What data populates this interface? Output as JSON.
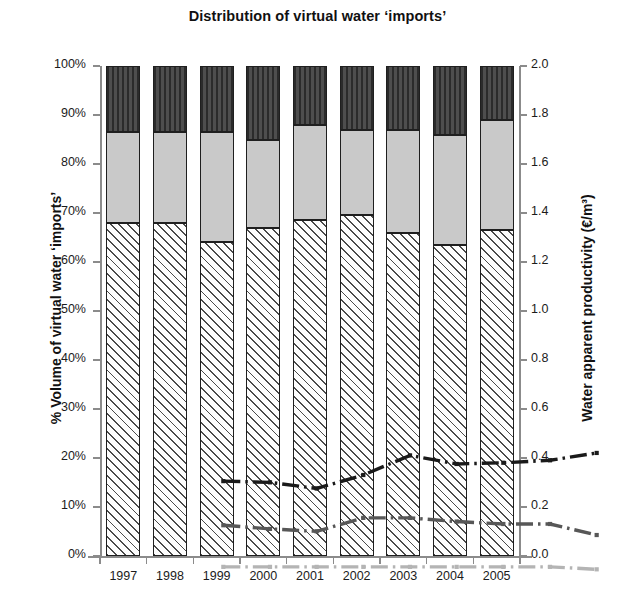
{
  "chart_data": {
    "type": "bar",
    "title": "Distribution of virtual water ‘imports’",
    "subtitle": "",
    "xlabel": "",
    "ylabel": "% Volume of virtual water ‘imports’",
    "ylabel_secondary": "Water apparent productivity (€/m³)",
    "categories": [
      "1997",
      "1998",
      "1999",
      "2000",
      "2001",
      "2002",
      "2003",
      "2004",
      "2005"
    ],
    "ylim": [
      0,
      100
    ],
    "ylim_secondary": [
      0,
      2.0
    ],
    "yticks": [
      "0%",
      "10%",
      "20%",
      "30%",
      "40%",
      "50%",
      "60%",
      "70%",
      "80%",
      "90%",
      "100%"
    ],
    "yticks_secondary": [
      "0.0",
      "0.2",
      "0.4",
      "0.6",
      "0.8",
      "1.0",
      "1.2",
      "1.4",
      "1.6",
      "1.8",
      "2.0"
    ],
    "grid": false,
    "legend": "none",
    "stacked": true,
    "series": [
      {
        "name": "hatched-segment",
        "axis": "left",
        "style": "diagonal-hatch",
        "color": "#4a4a4a",
        "values": [
          68,
          68,
          64,
          67,
          68.5,
          69.5,
          66,
          63.5,
          66.5
        ]
      },
      {
        "name": "light-grey-segment",
        "axis": "left",
        "style": "solid-light-grey",
        "color": "#c9c9c9",
        "values": [
          18.5,
          18.5,
          22.5,
          18,
          19.5,
          17.5,
          21,
          22.5,
          22.5
        ]
      },
      {
        "name": "dark-striped-segment",
        "axis": "left",
        "style": "vertical-stripe-dark",
        "color": "#4e4e4e",
        "values": [
          13.5,
          13.5,
          13.5,
          15,
          12,
          13,
          13,
          14,
          11
        ]
      }
    ],
    "line_series": [
      {
        "name": "black-productivity-line",
        "axis": "right",
        "color": "#1a1a1a",
        "style": "dash-dot",
        "marker": "square",
        "values": [
          0.575,
          0.57,
          0.545,
          0.6,
          0.68,
          0.645,
          0.65,
          0.66,
          0.69
        ]
      },
      {
        "name": "dark-grey-productivity-line",
        "axis": "right",
        "color": "#575757",
        "style": "dash-dot",
        "marker": "square",
        "values": [
          0.395,
          0.38,
          0.37,
          0.425,
          0.425,
          0.41,
          0.4,
          0.4,
          0.355
        ]
      },
      {
        "name": "light-grey-productivity-line",
        "axis": "right",
        "color": "#b4b4b4",
        "style": "dash-dot",
        "marker": "square",
        "values": [
          0.225,
          0.225,
          0.225,
          0.225,
          0.225,
          0.225,
          0.225,
          0.225,
          0.215
        ]
      }
    ]
  }
}
